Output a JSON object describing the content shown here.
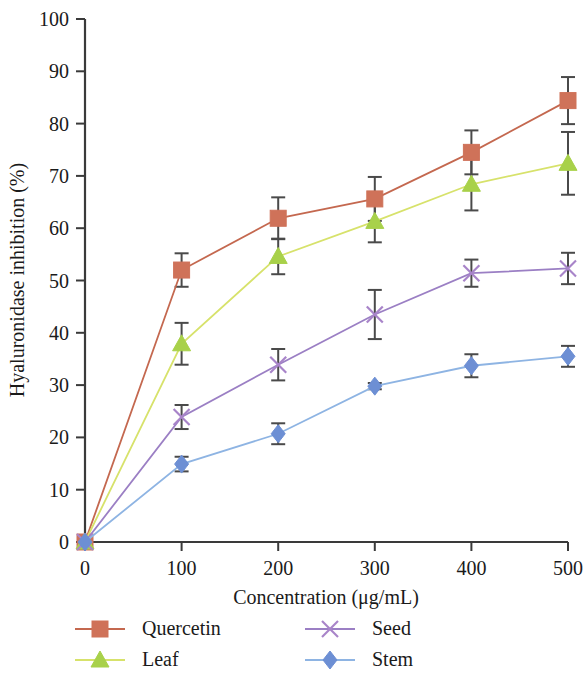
{
  "chart_data": {
    "type": "line",
    "title": "",
    "xlabel": "Concentration (μg/mL)",
    "ylabel": "Hyaluronidase inhibition (%)",
    "x": [
      0,
      100,
      200,
      300,
      400,
      500
    ],
    "xlim": [
      0,
      500
    ],
    "ylim": [
      0,
      100
    ],
    "xticks": [
      "0",
      "100",
      "200",
      "300",
      "400",
      "500"
    ],
    "yticks": [
      "0",
      "10",
      "20",
      "30",
      "40",
      "50",
      "60",
      "70",
      "80",
      "90",
      "100"
    ],
    "grid": false,
    "legend_position": "below-plot",
    "error_bars": true,
    "series": [
      {
        "name": "Quercetin",
        "color": "#c4684f",
        "marker": "square",
        "marker_color": "#cf7259",
        "values": [
          0,
          52.0,
          61.9,
          65.6,
          74.5,
          84.4
        ],
        "errors": [
          0,
          3.2,
          4.0,
          4.2,
          4.2,
          4.5
        ]
      },
      {
        "name": "Leaf",
        "color": "#d7e26b",
        "marker": "triangle",
        "marker_color": "#a8d14a",
        "values": [
          0,
          37.9,
          54.6,
          61.3,
          68.4,
          72.4
        ],
        "errors": [
          0,
          4.0,
          3.4,
          4.0,
          5.0,
          6.0
        ]
      },
      {
        "name": "Seed",
        "color": "#9b7fc4",
        "marker": "x",
        "marker_color": "#a884c9",
        "values": [
          0,
          23.9,
          33.9,
          43.5,
          51.4,
          52.3
        ],
        "errors": [
          0,
          2.3,
          3.0,
          4.7,
          2.6,
          3.0
        ]
      },
      {
        "name": "Stem",
        "color": "#8eb4e3",
        "marker": "diamond",
        "marker_color": "#6d8fd4",
        "values": [
          0,
          14.9,
          20.7,
          29.8,
          33.7,
          35.5
        ],
        "errors": [
          0,
          1.4,
          2.0,
          0.6,
          2.2,
          2.0
        ]
      }
    ]
  },
  "legend": {
    "entries": [
      {
        "label": "Quercetin"
      },
      {
        "label": "Seed"
      },
      {
        "label": "Leaf"
      },
      {
        "label": "Stem"
      }
    ]
  }
}
